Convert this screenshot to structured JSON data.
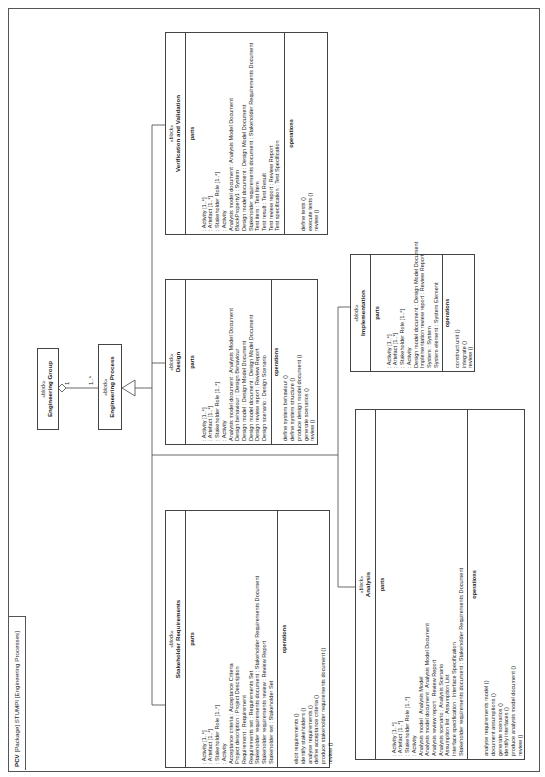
{
  "frame": {
    "kind": "PCV",
    "tab_label": "[Package] STUMPI [Engineering Processes]"
  },
  "stereotype": "«block»",
  "section_labels": {
    "parts": "parts",
    "operations": "operations"
  },
  "blocks": {
    "engineering_group": {
      "name": "Engineering Group"
    },
    "engineering_process": {
      "name": "Engineering Process"
    },
    "stakeholder_requirements": {
      "name": "Stakeholder Requirements",
      "parts": [
        ": Activity [1..*]",
        ": Artefact [1..*]",
        ": Stakeholder Role [1..*]",
        ": Activity",
        "Acceptance criteria : Acceptance Criteria",
        "Project description : Project Description",
        "Requirement : Requirement",
        "Requirements set : Requirements Set",
        "Stakeholder requirements document : Stakeholder Requirements Document",
        "Stakeholder requirements review : Review Report",
        "Stakeholder set : Stakeholder Set"
      ],
      "operations": [
        "elicit requirements ()",
        "identify stakeholders ()",
        "analyse requirements ()",
        "define acceptance criteria ()",
        "produce stakeholder requirements document ()",
        "review ()"
      ]
    },
    "design": {
      "name": "Design",
      "parts": [
        ": Activity [1..*]",
        ": Artefact [1..*]",
        ": Stakeholder Role [1..*]",
        ": Activity",
        "Analysis model document : Analysis Model Document",
        "Design behaviour : Design Behaviour",
        "Design model : Design Model Document",
        "Design model document : Design Model Document",
        "Design review report : Review Report",
        "Design scenario : Design Scenario"
      ],
      "operations": [
        "define system behaviour ()",
        "define system structure ()",
        "produce design model document ()",
        "generate scenarios ()",
        "review ()"
      ]
    },
    "verification_validation": {
      "name": "Verification and Validation",
      "parts": [
        ": Activity [1..*]",
        ": Artefact [1..*]",
        ": Stakeholder Role [1..*]",
        ": Activity",
        "Analysis model document : Analysis Model Document",
        "BlockProperty1 : System",
        "Design model document : Design Model Document",
        "Stakeholder requirements document : Stakeholder Requirements Document",
        "Test item : Test Item",
        "Test result : Test Result",
        "Test review report : Review Report",
        "Test specification : Test Specification"
      ],
      "operations": [
        "define tests ()",
        "execute tests ()",
        "review ()"
      ]
    },
    "implementation": {
      "name": "Implementation",
      "parts": [
        ": Activity [1..*]",
        ": Artefact [1..*]",
        ": Stakeholder Role [1..*]",
        ": Activity",
        "Design model document : Design Model Document",
        "Implementation review report : Review Report",
        "System : System",
        "System element : System Element"
      ],
      "operations": [
        "construct unit ()",
        "integrate ()",
        "review ()"
      ]
    },
    "analysis": {
      "name": "Analysis",
      "parts": [
        ": Activity [1..*]",
        ": Artefact [1..*]",
        ": Stakeholder Role [1..*]",
        ": Activity",
        "Analysis model : Analysis Model",
        "Analysis model document : Analysis Model Document",
        "Analysis review report : Review Report",
        "Analysis scenario : Analysis Scenario",
        "Assumption list : Assumption List",
        "Interface specification : Interface Specification",
        "Stakeholder requirements document : Stakeholder Requirements Document"
      ],
      "operations": [
        "analyse requirements model ()",
        "document assumptions ()",
        "generate scenarios ()",
        "identify interfaces ()",
        "produce analysis model document ()",
        "review ()"
      ]
    }
  },
  "relationships": {
    "aggregation": {
      "from": "Engineering Group",
      "to": "Engineering Process",
      "group_end": "1",
      "process_end": "1..*"
    },
    "generalization": {
      "parent": "Engineering Process",
      "children": [
        "Stakeholder Requirements",
        "Analysis",
        "Design",
        "Implementation",
        "Verification and Validation"
      ]
    }
  }
}
